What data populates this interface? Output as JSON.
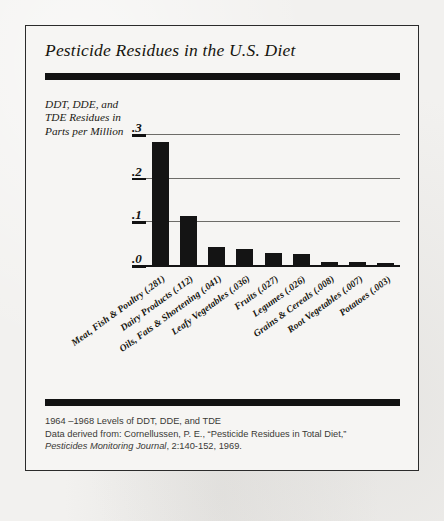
{
  "figure": {
    "title": "Pesticide Residues in the U.S. Diet",
    "y_axis_caption": "DDT, DDE, and TDE Residues in Parts per Million",
    "footer": {
      "line1": "1964 –1968 Levels of DDT, DDE, and TDE",
      "line2": "Data derived from: Cornellussen, P. E., “Pesticide Residues in Total Diet,”",
      "line3_italic": "Pesticides Monitoring Journal",
      "line3_rest": ", 2:140-152, 1969."
    },
    "colors": {
      "bar": "#141414",
      "rule": "#121212",
      "gridline": "#6d6c68",
      "paper": "#f6f5f3",
      "border": "#2b2b2b"
    }
  },
  "chart_data": {
    "type": "bar",
    "title": "Pesticide Residues in the U.S. Diet",
    "xlabel": "",
    "ylabel": "DDT, DDE, and TDE Residues in Parts per Million",
    "ylim": [
      0,
      0.3
    ],
    "yticks": [
      0,
      0.1,
      0.2,
      0.3
    ],
    "ytick_labels": [
      ".0",
      ".1",
      ".2",
      ".3"
    ],
    "grid": true,
    "legend": false,
    "categories": [
      "Meat, Fish & Poultry",
      "Dairy Products",
      "Oils, Fats & Shortening",
      "Leafy Vegetables",
      "Fruits",
      "Legumes",
      "Grains & Cereals",
      "Root Vegetables",
      "Potatoes"
    ],
    "values": [
      0.281,
      0.112,
      0.041,
      0.036,
      0.027,
      0.026,
      0.008,
      0.007,
      0.003
    ],
    "value_labels": [
      "(.281)",
      "(.112)",
      "(.041)",
      "(.036)",
      "(.027)",
      "(.026)",
      "(.008)",
      "(.007)",
      "(.003)"
    ]
  }
}
